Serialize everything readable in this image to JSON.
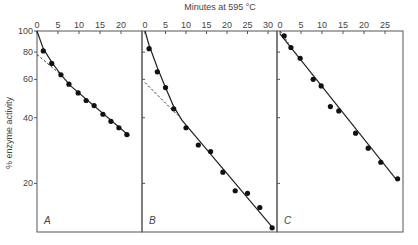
{
  "chart_data": {
    "type": "scatter",
    "title": "Minutes at 595 °C",
    "xlabel": "Minutes at 595 °C",
    "ylabel": "% enzyme activity",
    "yscale": "log",
    "ylim": [
      12,
      100
    ],
    "yticks": [
      20,
      40,
      60,
      80,
      100
    ],
    "ytick_labels": [
      "20",
      "40",
      "60",
      "80",
      "100"
    ],
    "grid": false,
    "panels": [
      {
        "label": "A",
        "xlim": [
          0,
          25
        ],
        "xticks": [
          0,
          5,
          10,
          15,
          20
        ],
        "xtick_labels": [
          "0",
          "5",
          "10",
          "15",
          "20"
        ],
        "points": [
          [
            1.5,
            81
          ],
          [
            3.5,
            71
          ],
          [
            5.7,
            63
          ],
          [
            7.6,
            57
          ],
          [
            9.8,
            52
          ],
          [
            11.7,
            48
          ],
          [
            13.6,
            45.5
          ],
          [
            15.7,
            41.5
          ],
          [
            17.6,
            38.5
          ],
          [
            19.5,
            36
          ],
          [
            21.4,
            33.5
          ]
        ],
        "fit_curve": [
          [
            0,
            100
          ],
          [
            1.5,
            83
          ],
          [
            3.5,
            72
          ],
          [
            5.7,
            63
          ],
          [
            8,
            56
          ],
          [
            22,
            33
          ]
        ],
        "extrapolation": [
          [
            0,
            78
          ],
          [
            5.7,
            63
          ]
        ]
      },
      {
        "label": "B",
        "xlim": [
          0,
          33
        ],
        "xticks": [
          0,
          5,
          10,
          15,
          20,
          25,
          30
        ],
        "xtick_labels": [
          "0",
          "5",
          "10",
          "15",
          "20",
          "25",
          "30"
        ],
        "points": [
          [
            1,
            83
          ],
          [
            3,
            65
          ],
          [
            5,
            55
          ],
          [
            7,
            44
          ],
          [
            10,
            36
          ],
          [
            13,
            30
          ],
          [
            16,
            28
          ],
          [
            19,
            22.5
          ],
          [
            22,
            18.5
          ],
          [
            25,
            18
          ],
          [
            28,
            15.5
          ],
          [
            31,
            12.5
          ]
        ],
        "fit_curve": [
          [
            0,
            100
          ],
          [
            1,
            86
          ],
          [
            3,
            68
          ],
          [
            5,
            55
          ],
          [
            7,
            45
          ],
          [
            9,
            39
          ],
          [
            31.5,
            12.3
          ]
        ],
        "extrapolation": [
          [
            0,
            58
          ],
          [
            8,
            41
          ]
        ]
      },
      {
        "label": "C",
        "xlim": [
          0,
          29
        ],
        "xticks": [
          0,
          5,
          10,
          15,
          20,
          25
        ],
        "xtick_labels": [
          "0",
          "5",
          "10",
          "15",
          "20",
          "25"
        ],
        "points": [
          [
            1,
            95
          ],
          [
            2.6,
            84
          ],
          [
            4.8,
            75
          ],
          [
            7.9,
            60
          ],
          [
            9.8,
            56
          ],
          [
            12,
            45
          ],
          [
            14,
            43
          ],
          [
            18,
            34
          ],
          [
            21,
            29
          ],
          [
            24,
            25
          ],
          [
            28,
            21
          ]
        ],
        "fit_curve": [
          [
            0,
            97
          ],
          [
            28,
            20.5
          ]
        ],
        "extrapolation": [
          [
            0,
            100
          ],
          [
            2,
            88
          ]
        ]
      }
    ]
  }
}
